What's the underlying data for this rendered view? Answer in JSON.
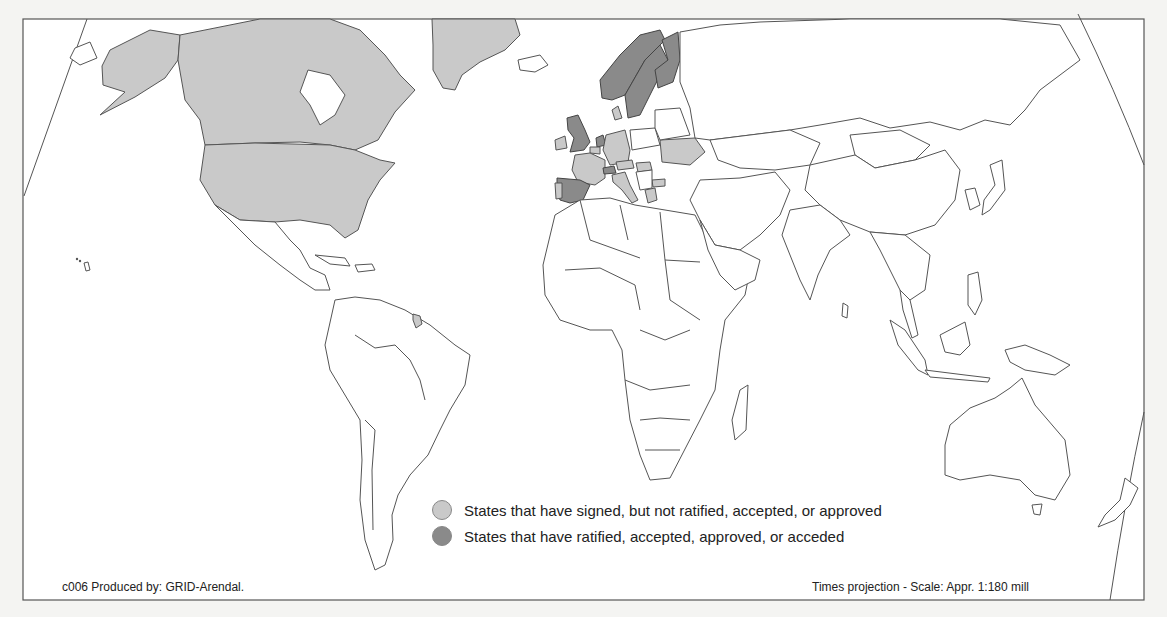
{
  "map": {
    "projection": "Times projection",
    "colors": {
      "background": "#f4f4f2",
      "land": "#ffffff",
      "signed_not_ratified": "#c9c9c9",
      "ratified": "#8a8a8a",
      "border": "#555555"
    },
    "regions": {
      "signed_not_ratified": [
        "Canada",
        "United States",
        "Alaska",
        "Greenland",
        "France",
        "Germany",
        "Italy",
        "Portugal",
        "Ireland",
        "Belgium",
        "Denmark",
        "Austria",
        "Ukraine",
        "Hungary",
        "Poland-area",
        "Greece",
        "Bulgaria",
        "French Guiana"
      ],
      "ratified": [
        "Norway",
        "Sweden",
        "Finland",
        "United Kingdom",
        "Netherlands",
        "Spain",
        "Switzerland"
      ]
    }
  },
  "legend": {
    "items": [
      {
        "label": "States that have signed, but not ratified, accepted, or approved",
        "color": "#c9c9c9"
      },
      {
        "label": "States that have ratified, accepted, approved, or acceded",
        "color": "#8a8a8a"
      }
    ]
  },
  "footer": {
    "credit": "c006 Produced by: GRID-Arendal.",
    "scale": "Times projection - Scale: Appr. 1:180 mill"
  }
}
